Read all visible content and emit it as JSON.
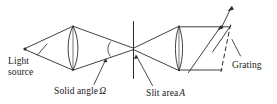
{
  "figure": {
    "type": "optical-schematic",
    "background_color": "#ffffff",
    "stroke_color": "#2b2b2b",
    "labels": {
      "light_source_line1": "Light",
      "light_source_line2": "source",
      "solid_angle_text": "Solid angle",
      "solid_angle_symbol": "Ω",
      "slit_area_text": "Slit area",
      "slit_area_symbol": "A",
      "grating": "Grating"
    },
    "components": [
      {
        "name": "light-source-point",
        "label": "Light source"
      },
      {
        "name": "collimating-lens",
        "label": ""
      },
      {
        "name": "solid-angle-arc",
        "label": "Solid angle Ω"
      },
      {
        "name": "slit",
        "label": "Slit area A"
      },
      {
        "name": "focusing-lens",
        "label": ""
      },
      {
        "name": "grating",
        "label": "Grating"
      },
      {
        "name": "diffracted-beam-upper",
        "label": ""
      },
      {
        "name": "diffracted-beam-lower",
        "label": ""
      }
    ]
  }
}
